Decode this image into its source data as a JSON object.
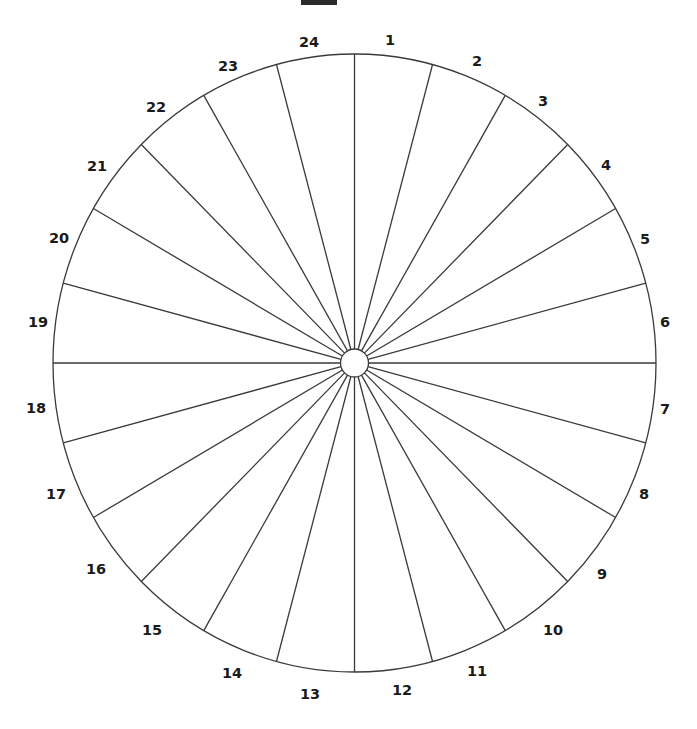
{
  "figure": {
    "title_bar": {
      "name": "cropped-caption-bar",
      "color": "#2b2b2b",
      "text": ""
    },
    "background_color": "#ffffff",
    "stroke_color": "#3a3a3a",
    "fill_color": "#ffffff",
    "line_width": 1.3
  },
  "chart_data": {
    "type": "pie",
    "title": "",
    "subtitle": "",
    "xlabel": "",
    "ylabel": "",
    "legend_position": "none",
    "grid": false,
    "sector_count": 24,
    "equal_sectors": true,
    "sector_angle_degrees": 15,
    "start_angle_degrees": 0,
    "direction": "clockwise",
    "center": {
      "x": 354.5,
      "y": 363.0
    },
    "radius_x": 301.5,
    "radius_y": 309.0,
    "hub_radius": 14.0,
    "categories": [
      "1",
      "2",
      "3",
      "4",
      "5",
      "6",
      "7",
      "8",
      "9",
      "10",
      "11",
      "12",
      "13",
      "14",
      "15",
      "16",
      "17",
      "18",
      "19",
      "20",
      "21",
      "22",
      "23",
      "24"
    ],
    "values": [
      15,
      15,
      15,
      15,
      15,
      15,
      15,
      15,
      15,
      15,
      15,
      15,
      15,
      15,
      15,
      15,
      15,
      15,
      15,
      15,
      15,
      15,
      15,
      15
    ],
    "labels": [
      {
        "text": "1",
        "x": 390,
        "y": 40
      },
      {
        "text": "2",
        "x": 477,
        "y": 61
      },
      {
        "text": "3",
        "x": 543,
        "y": 101
      },
      {
        "text": "4",
        "x": 606,
        "y": 165
      },
      {
        "text": "5",
        "x": 645,
        "y": 239
      },
      {
        "text": "6",
        "x": 665,
        "y": 322
      },
      {
        "text": "7",
        "x": 665,
        "y": 409
      },
      {
        "text": "8",
        "x": 644,
        "y": 494
      },
      {
        "text": "9",
        "x": 602,
        "y": 574
      },
      {
        "text": "10",
        "x": 553,
        "y": 630
      },
      {
        "text": "11",
        "x": 477,
        "y": 671
      },
      {
        "text": "12",
        "x": 402,
        "y": 690
      },
      {
        "text": "13",
        "x": 310,
        "y": 694
      },
      {
        "text": "14",
        "x": 232,
        "y": 673
      },
      {
        "text": "15",
        "x": 152,
        "y": 630
      },
      {
        "text": "16",
        "x": 96,
        "y": 569
      },
      {
        "text": "17",
        "x": 56,
        "y": 494
      },
      {
        "text": "18",
        "x": 36,
        "y": 408
      },
      {
        "text": "19",
        "x": 38,
        "y": 322
      },
      {
        "text": "20",
        "x": 59,
        "y": 238
      },
      {
        "text": "21",
        "x": 97,
        "y": 166
      },
      {
        "text": "22",
        "x": 156,
        "y": 107
      },
      {
        "text": "23",
        "x": 228,
        "y": 66
      },
      {
        "text": "24",
        "x": 309,
        "y": 42
      }
    ]
  }
}
